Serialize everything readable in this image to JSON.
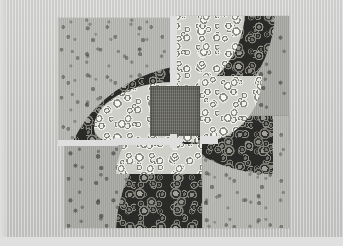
{
  "image": {
    "kind": "photograph",
    "subject": "Textile quilt artwork with interlocking pinwheel spiral motif",
    "width_px": 343,
    "height_px": 246,
    "alt_text": "Photograph of a square quilt made of four rotationally symmetric panels forming an interlocking pinwheel of dark circle-printed spiral arms over speckled gray backgrounds, with a dark olive square at the center"
  },
  "palette": {
    "paper_background": "#cbcbc9",
    "paper_bottom_strip": "#e0e0e0",
    "sashing_white": "#dedede",
    "panel_background_light": "#b6b6b2",
    "panel_background_mid": "#a9a9a5",
    "spiral_arm_dark": "#2a2a28",
    "spiral_arm_highlight": "#9a9a92",
    "inner_spiral_light": "#cfcfc9",
    "center_square": "#6e6e66"
  },
  "composition": {
    "stage": {
      "left": 58,
      "top": 16,
      "width": 230,
      "height": 212
    },
    "panels": [
      {
        "id": "panel-top-left",
        "label": "Top-left panel",
        "background": "speckle-light",
        "rect": {
          "left": 0,
          "top": 0,
          "width": 112,
          "height": 128
        },
        "arm_direction": "curves from left edge down and right"
      },
      {
        "id": "panel-top-right",
        "label": "Top-right panel",
        "background": "speckle-mid",
        "rect": {
          "left": 118,
          "top": 0,
          "width": 112,
          "height": 128
        },
        "arm_direction": "curves from top edge down and left"
      },
      {
        "id": "panel-bottom-right",
        "label": "Bottom-right panel",
        "background": "speckle-light",
        "rect": {
          "left": 118,
          "top": 100,
          "width": 112,
          "height": 112
        },
        "arm_direction": "curves from right edge up and left"
      },
      {
        "id": "panel-bottom-left",
        "label": "Bottom-left panel",
        "background": "speckle-mid",
        "rect": {
          "left": 6,
          "top": 126,
          "width": 138,
          "height": 86
        },
        "arm_direction": "curves from bottom edge up and right"
      }
    ],
    "center_square": {
      "left": 92,
      "top": 72,
      "width": 50,
      "height": 48
    },
    "sashing_lines": [
      {
        "id": "vertical-sashing",
        "orientation": "vertical",
        "left": 112,
        "top": 0,
        "width": 7,
        "height": 130
      },
      {
        "id": "horizontal-sashing",
        "orientation": "horizontal",
        "left": 0,
        "top": 124,
        "width": 150,
        "height": 6
      }
    ]
  },
  "motifs": {
    "circle_print": "concentric rings of varied diameter, 3-12 px, dense packing",
    "speckle_print": "small irregular dots on woven gray ground",
    "weave_texture": "fine vertical warp lines visible across whole photograph"
  }
}
